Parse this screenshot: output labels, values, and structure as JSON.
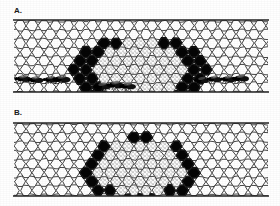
{
  "figure": {
    "kind": "two-panel line drawing of honey bee comb cross-sections",
    "background_color": "#ffffff",
    "ink_color": "#1a1a1a"
  },
  "panels": [
    {
      "id": "A",
      "label": "A.",
      "frame": {
        "x": 14,
        "y": 20,
        "width": 254,
        "height": 72
      },
      "regions": {
        "empty_comb": {
          "name": "empty-comb",
          "fill": "#ffffff",
          "stroke": "#262626"
        },
        "sealed_brood": {
          "name": "sealed-brood-dark-cells",
          "fill": "#000000"
        },
        "stippled_core": {
          "name": "stippled-honey-cells",
          "fill": "#fdfdfd",
          "stipple": "#4a4a4a"
        }
      },
      "dark_mass": {
        "cx": 140,
        "cy": 56,
        "rx": 68,
        "ry": 36
      },
      "stippled_mass": {
        "cx": 138,
        "cy": 55,
        "rx": 47,
        "ry": 31
      },
      "bee_clusters": [
        {
          "name": "bee-cluster-left",
          "x": 22,
          "y": 80,
          "count": 4
        },
        {
          "name": "bee-cluster-right",
          "x": 200,
          "y": 80,
          "count": 4
        },
        {
          "name": "bee-cluster-center-bottom",
          "x": 100,
          "y": 86,
          "count": 3
        }
      ],
      "bee_count_visible": 11
    },
    {
      "id": "B",
      "label": "B.",
      "frame": {
        "x": 14,
        "y": 122,
        "width": 254,
        "height": 73
      },
      "regions": {
        "empty_comb": {
          "name": "empty-comb",
          "fill": "#ffffff",
          "stroke": "#262626"
        },
        "sealed_brood": {
          "name": "sealed-brood-dark-cells",
          "fill": "#000000"
        },
        "stippled_core": {
          "name": "stippled-honey-cells",
          "fill": "#fdfdfd",
          "stipple": "#4a4a4a"
        }
      },
      "dark_mass": {
        "cx": 140,
        "cy": 50,
        "rx": 57,
        "ry": 33
      },
      "stippled_mass": {
        "cx": 140,
        "cy": 50,
        "rx": 43,
        "ry": 29
      },
      "bee_clusters": [],
      "bee_count_visible": 0
    }
  ],
  "cell_geometry": {
    "cell_width": 12,
    "cell_height": 11,
    "rows_per_panel": 7,
    "cols_per_panel": 22,
    "shape": "elongated-hexagon"
  }
}
